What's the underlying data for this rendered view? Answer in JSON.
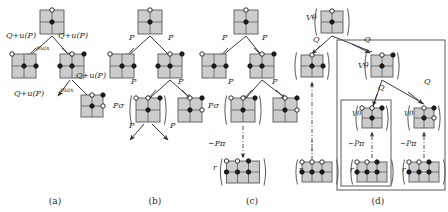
{
  "figure": {
    "background_color": "#ffffff",
    "node_fill": "#cccccc",
    "node_stroke": "#5a5a5a",
    "edge_color": "#3a3a3a",
    "text_color": "#2b2b2b",
    "vertex_open_fill": "#ffffff",
    "vertex_filled_fill": "#1a1a1a"
  },
  "captions": [
    {
      "id": "a",
      "label": "(a)",
      "x": 55,
      "y": 196
    },
    {
      "id": "b",
      "label": "(b)",
      "x": 155,
      "y": 196
    },
    {
      "id": "c",
      "label": "(c)",
      "x": 252,
      "y": 196
    },
    {
      "id": "d",
      "label": "(d)",
      "x": 378,
      "y": 196
    }
  ],
  "panels": {
    "a": {
      "name": "panel-a",
      "edge_labels": [
        {
          "text": "Q+u(P)",
          "x": 6,
          "y": 38,
          "size": 8
        },
        {
          "text": "Q+u(P)",
          "x": 58,
          "y": 38,
          "size": 8
        },
        {
          "text": "max",
          "x": 36,
          "y": 50,
          "size": 6.5
        },
        {
          "text": "Q+u(P)",
          "x": 76,
          "y": 78,
          "size": 8
        },
        {
          "text": "Q+u(P)",
          "x": 14,
          "y": 96,
          "size": 8
        },
        {
          "text": "max",
          "x": 60,
          "y": 92,
          "size": 6.5
        }
      ],
      "nodes": [
        {
          "name": "root-node",
          "cx": 52,
          "cy": 22,
          "cols": 2,
          "rows": 2,
          "cell": 12,
          "paren": false,
          "vertices": [
            {
              "x": 1,
              "y": 0,
              "fill": "open"
            },
            {
              "x": 1,
              "y": 1,
              "fill": "filled"
            }
          ]
        },
        {
          "name": "child-left-node",
          "cx": 24,
          "cy": 66,
          "cols": 2,
          "rows": 2,
          "cell": 12,
          "paren": false,
          "vertices": [
            {
              "x": 0,
              "y": 0,
              "fill": "open"
            },
            {
              "x": 1,
              "y": 1,
              "fill": "filled"
            },
            {
              "x": 2,
              "y": 1,
              "fill": "filled"
            }
          ]
        },
        {
          "name": "child-right-node",
          "cx": 72,
          "cy": 66,
          "cols": 2,
          "rows": 2,
          "cell": 12,
          "paren": false,
          "vertices": [
            {
              "x": 1,
              "y": 0,
              "fill": "open"
            },
            {
              "x": 2,
              "y": 0,
              "fill": "filled"
            },
            {
              "x": 1,
              "y": 1,
              "fill": "filled"
            },
            {
              "x": 0,
              "y": 1,
              "fill": "filled"
            }
          ]
        },
        {
          "name": "grandchild-node",
          "cx": 92,
          "cy": 106,
          "cols": 2,
          "rows": 2,
          "cell": 11,
          "paren": false,
          "vertices": [
            {
              "x": 1,
              "y": 0,
              "fill": "open"
            },
            {
              "x": 2,
              "y": 0,
              "fill": "filled"
            },
            {
              "x": 1,
              "y": 1,
              "fill": "filled"
            },
            {
              "x": 2,
              "y": 1,
              "fill": "open"
            }
          ]
        }
      ]
    },
    "b": {
      "name": "panel-b",
      "edge_labels": [
        {
          "text": "P",
          "x": 129,
          "y": 40,
          "size": 8
        },
        {
          "text": "P",
          "x": 168,
          "y": 40,
          "size": 8
        },
        {
          "text": "P",
          "x": 131,
          "y": 84,
          "size": 8
        },
        {
          "text": "P",
          "x": 178,
          "y": 84,
          "size": 8
        },
        {
          "text": "Pσ",
          "x": 113,
          "y": 108,
          "size": 8
        },
        {
          "text": "P",
          "x": 129,
          "y": 128,
          "size": 8
        },
        {
          "text": "P",
          "x": 170,
          "y": 128,
          "size": 8
        }
      ],
      "nodes": [
        {
          "name": "root-node",
          "cx": 150,
          "cy": 22,
          "cols": 2,
          "rows": 2,
          "cell": 12,
          "paren": false,
          "vertices": [
            {
              "x": 1,
              "y": 0,
              "fill": "open"
            },
            {
              "x": 1,
              "y": 1,
              "fill": "filled"
            }
          ]
        },
        {
          "name": "child-left-node",
          "cx": 122,
          "cy": 66,
          "cols": 2,
          "rows": 2,
          "cell": 12,
          "paren": false,
          "vertices": [
            {
              "x": 0,
              "y": 0,
              "fill": "open"
            },
            {
              "x": 1,
              "y": 1,
              "fill": "filled"
            },
            {
              "x": 2,
              "y": 1,
              "fill": "filled"
            }
          ]
        },
        {
          "name": "child-right-node",
          "cx": 170,
          "cy": 66,
          "cols": 2,
          "rows": 2,
          "cell": 12,
          "paren": false,
          "vertices": [
            {
              "x": 1,
              "y": 0,
              "fill": "open"
            },
            {
              "x": 2,
              "y": 0,
              "fill": "filled"
            },
            {
              "x": 1,
              "y": 1,
              "fill": "filled"
            },
            {
              "x": 0,
              "y": 1,
              "fill": "filled"
            }
          ]
        },
        {
          "name": "expanded-node",
          "cx": 148,
          "cy": 110,
          "cols": 2,
          "rows": 2,
          "cell": 12,
          "paren": true,
          "vertices": [
            {
              "x": 0,
              "y": 0,
              "fill": "open"
            },
            {
              "x": 1,
              "y": 0,
              "fill": "open"
            },
            {
              "x": 2,
              "y": 0,
              "fill": "filled"
            },
            {
              "x": 1,
              "y": 1,
              "fill": "filled"
            }
          ]
        },
        {
          "name": "sibling-node",
          "cx": 190,
          "cy": 110,
          "cols": 2,
          "rows": 2,
          "cell": 12,
          "paren": false,
          "vertices": [
            {
              "x": 1,
              "y": 0,
              "fill": "open"
            },
            {
              "x": 2,
              "y": 0,
              "fill": "filled"
            },
            {
              "x": 1,
              "y": 1,
              "fill": "filled"
            },
            {
              "x": 2,
              "y": 1,
              "fill": "open"
            }
          ]
        }
      ]
    },
    "c": {
      "name": "panel-c",
      "edge_labels": [
        {
          "text": "P",
          "x": 222,
          "y": 40,
          "size": 8
        },
        {
          "text": "P",
          "x": 262,
          "y": 40,
          "size": 8
        },
        {
          "text": "P",
          "x": 228,
          "y": 84,
          "size": 8
        },
        {
          "text": "P",
          "x": 272,
          "y": 84,
          "size": 8
        },
        {
          "text": "Pσ",
          "x": 208,
          "y": 108,
          "size": 8
        },
        {
          "text": "∼Pπ",
          "x": 208,
          "y": 146,
          "size": 8
        },
        {
          "text": "r",
          "x": 213,
          "y": 170,
          "size": 8
        }
      ],
      "nodes": [
        {
          "name": "root-node",
          "cx": 246,
          "cy": 22,
          "cols": 2,
          "rows": 2,
          "cell": 12,
          "paren": false,
          "vertices": [
            {
              "x": 1,
              "y": 0,
              "fill": "open"
            },
            {
              "x": 1,
              "y": 1,
              "fill": "filled"
            }
          ]
        },
        {
          "name": "child-left-node",
          "cx": 214,
          "cy": 66,
          "cols": 2,
          "rows": 2,
          "cell": 12,
          "paren": false,
          "vertices": [
            {
              "x": 0,
              "y": 0,
              "fill": "open"
            },
            {
              "x": 1,
              "y": 1,
              "fill": "filled"
            },
            {
              "x": 2,
              "y": 1,
              "fill": "filled"
            }
          ]
        },
        {
          "name": "child-right-node",
          "cx": 262,
          "cy": 66,
          "cols": 2,
          "rows": 2,
          "cell": 12,
          "paren": false,
          "vertices": [
            {
              "x": 1,
              "y": 0,
              "fill": "open"
            },
            {
              "x": 2,
              "y": 0,
              "fill": "filled"
            },
            {
              "x": 1,
              "y": 1,
              "fill": "filled"
            },
            {
              "x": 0,
              "y": 1,
              "fill": "filled"
            }
          ]
        },
        {
          "name": "expanded-node",
          "cx": 243,
          "cy": 110,
          "cols": 2,
          "rows": 2,
          "cell": 12,
          "paren": true,
          "vertices": [
            {
              "x": 0,
              "y": 0,
              "fill": "open"
            },
            {
              "x": 1,
              "y": 0,
              "fill": "open"
            },
            {
              "x": 2,
              "y": 0,
              "fill": "filled"
            },
            {
              "x": 1,
              "y": 1,
              "fill": "filled"
            }
          ]
        },
        {
          "name": "sibling-node",
          "cx": 285,
          "cy": 110,
          "cols": 2,
          "rows": 2,
          "cell": 12,
          "paren": false,
          "vertices": [
            {
              "x": 1,
              "y": 0,
              "fill": "open"
            },
            {
              "x": 2,
              "y": 0,
              "fill": "filled"
            },
            {
              "x": 1,
              "y": 1,
              "fill": "filled"
            },
            {
              "x": 2,
              "y": 1,
              "fill": "open"
            }
          ]
        },
        {
          "name": "terminal-node",
          "cx": 243,
          "cy": 172,
          "cols": 3,
          "rows": 1,
          "cell": 11,
          "paren": true,
          "vertices": [
            {
              "x": 0,
              "y": 0,
              "fill": "open"
            },
            {
              "x": 1,
              "y": 0,
              "fill": "open"
            },
            {
              "x": 2,
              "y": 0,
              "fill": "filled"
            },
            {
              "x": 0,
              "y": 1,
              "fill": "filled"
            },
            {
              "x": 1,
              "y": 1,
              "fill": "filled"
            },
            {
              "x": 2,
              "y": 1,
              "fill": "filled"
            }
          ]
        }
      ]
    },
    "d": {
      "name": "panel-d",
      "edge_labels": [
        {
          "text": "Vθ",
          "x": 306,
          "y": 20,
          "size": 8
        },
        {
          "text": "Q",
          "x": 313,
          "y": 42,
          "size": 8
        },
        {
          "text": "Q",
          "x": 364,
          "y": 42,
          "size": 8
        },
        {
          "text": "Vθ",
          "x": 358,
          "y": 68,
          "size": 8
        },
        {
          "text": "Q",
          "x": 378,
          "y": 90,
          "size": 8
        },
        {
          "text": "Q",
          "x": 424,
          "y": 84,
          "size": 8
        },
        {
          "text": "Vθ",
          "x": 352,
          "y": 116,
          "size": 7
        },
        {
          "text": "Vθ",
          "x": 404,
          "y": 116,
          "size": 7
        },
        {
          "text": "∼Pπ",
          "x": 348,
          "y": 146,
          "size": 7.5
        },
        {
          "text": "∼Pπ",
          "x": 400,
          "y": 146,
          "size": 7.5
        },
        {
          "text": "r",
          "x": 350,
          "y": 172,
          "size": 7.5
        },
        {
          "text": "r",
          "x": 402,
          "y": 172,
          "size": 7.5
        },
        {
          "text": "r",
          "x": 299,
          "y": 172,
          "size": 7.5
        }
      ],
      "nodes": [
        {
          "name": "root-node",
          "cx": 332,
          "cy": 22,
          "cols": 2,
          "rows": 2,
          "cell": 11,
          "paren": true,
          "vertices": [
            {
              "x": 1,
              "y": 0,
              "fill": "open"
            },
            {
              "x": 1,
              "y": 1,
              "fill": "filled"
            }
          ]
        },
        {
          "name": "left-branch-node",
          "cx": 312,
          "cy": 66,
          "cols": 2,
          "rows": 2,
          "cell": 11,
          "paren": true,
          "vertices": [
            {
              "x": 1,
              "y": 0,
              "fill": "open"
            },
            {
              "x": 1,
              "y": 1,
              "fill": "filled"
            },
            {
              "x": 2,
              "y": 1,
              "fill": "filled"
            }
          ]
        },
        {
          "name": "right-branch-node",
          "cx": 382,
          "cy": 66,
          "cols": 2,
          "rows": 2,
          "cell": 11,
          "paren": true,
          "vertices": [
            {
              "x": 1,
              "y": 0,
              "fill": "open"
            },
            {
              "x": 2,
              "y": 0,
              "fill": "filled"
            },
            {
              "x": 1,
              "y": 1,
              "fill": "filled"
            }
          ]
        },
        {
          "name": "subtree-left-node",
          "cx": 372,
          "cy": 118,
          "cols": 2,
          "rows": 2,
          "cell": 10,
          "paren": true,
          "vertices": [
            {
              "x": 0,
              "y": 0,
              "fill": "open"
            },
            {
              "x": 1,
              "y": 0,
              "fill": "open"
            },
            {
              "x": 2,
              "y": 0,
              "fill": "filled"
            },
            {
              "x": 1,
              "y": 1,
              "fill": "filled"
            }
          ]
        },
        {
          "name": "subtree-right-node",
          "cx": 424,
          "cy": 118,
          "cols": 2,
          "rows": 2,
          "cell": 10,
          "paren": true,
          "vertices": [
            {
              "x": 1,
              "y": 0,
              "fill": "open"
            },
            {
              "x": 2,
              "y": 0,
              "fill": "filled"
            },
            {
              "x": 1,
              "y": 1,
              "fill": "filled"
            },
            {
              "x": 2,
              "y": 1,
              "fill": "open"
            }
          ]
        },
        {
          "name": "leaf-left-node",
          "cx": 372,
          "cy": 172,
          "cols": 3,
          "rows": 1,
          "cell": 10,
          "paren": true,
          "vertices": [
            {
              "x": 0,
              "y": 0,
              "fill": "open"
            },
            {
              "x": 1,
              "y": 0,
              "fill": "open"
            },
            {
              "x": 2,
              "y": 0,
              "fill": "filled"
            },
            {
              "x": 0,
              "y": 1,
              "fill": "filled"
            },
            {
              "x": 1,
              "y": 1,
              "fill": "filled"
            },
            {
              "x": 2,
              "y": 1,
              "fill": "filled"
            }
          ]
        },
        {
          "name": "leaf-right-node",
          "cx": 424,
          "cy": 172,
          "cols": 3,
          "rows": 1,
          "cell": 10,
          "paren": true,
          "vertices": [
            {
              "x": 0,
              "y": 0,
              "fill": "open"
            },
            {
              "x": 1,
              "y": 0,
              "fill": "open"
            },
            {
              "x": 2,
              "y": 0,
              "fill": "filled"
            },
            {
              "x": 0,
              "y": 1,
              "fill": "filled"
            },
            {
              "x": 1,
              "y": 1,
              "fill": "filled"
            },
            {
              "x": 2,
              "y": 1,
              "fill": "filled"
            }
          ]
        },
        {
          "name": "leaf-far-left-node",
          "cx": 317,
          "cy": 172,
          "cols": 3,
          "rows": 1,
          "cell": 10,
          "paren": true,
          "vertices": [
            {
              "x": 0,
              "y": 0,
              "fill": "open"
            },
            {
              "x": 1,
              "y": 0,
              "fill": "open"
            },
            {
              "x": 2,
              "y": 0,
              "fill": "open"
            },
            {
              "x": 0,
              "y": 1,
              "fill": "filled"
            },
            {
              "x": 1,
              "y": 1,
              "fill": "filled"
            },
            {
              "x": 2,
              "y": 1,
              "fill": "filled"
            }
          ]
        }
      ],
      "boxes": [
        {
          "name": "outer-subtree-box",
          "x": 337,
          "y": 40,
          "w": 108,
          "h": 150
        },
        {
          "name": "inner-subtree-box-left",
          "x": 341,
          "y": 100,
          "w": 50,
          "h": 86
        }
      ],
      "ellipsis": {
        "name": "vertical-ellipsis",
        "x": 312,
        "y": 142
      }
    }
  }
}
